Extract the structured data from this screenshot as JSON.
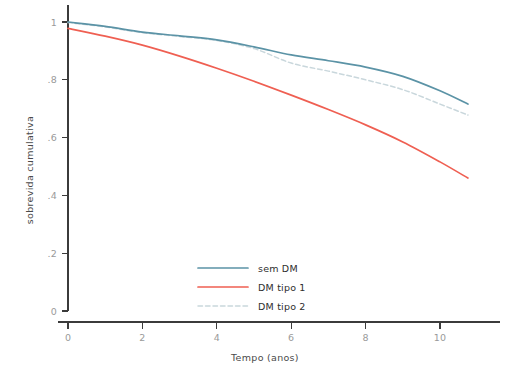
{
  "chart_data": {
    "type": "line",
    "title": "",
    "xlabel": "Tempo (anos)",
    "ylabel": "sobrevida cumulativa",
    "xlim": [
      0,
      11.6
    ],
    "ylim": [
      0,
      1.06
    ],
    "grid": false,
    "legend_position": "inside-bottom-center",
    "xticks": [
      "0",
      "2",
      "4",
      "6",
      "8",
      "10"
    ],
    "xtick_values": [
      0,
      2,
      4,
      6,
      8,
      10
    ],
    "yticks": [
      "0",
      ".2",
      ".4",
      ".6",
      ".8",
      "1"
    ],
    "ytick_values": [
      0,
      0.2,
      0.4,
      0.6,
      0.8,
      1.0
    ],
    "x": [
      0,
      1,
      2,
      3,
      4,
      5,
      6,
      7,
      8,
      9,
      10,
      10.75
    ],
    "series": [
      {
        "name": "sem DM",
        "color": "#5b93a6",
        "style": "solid",
        "values": [
          1.0,
          0.985,
          0.965,
          0.952,
          0.938,
          0.914,
          0.886,
          0.866,
          0.844,
          0.812,
          0.762,
          0.716
        ]
      },
      {
        "name": "DM tipo 1",
        "color": "#ef5f52",
        "style": "solid",
        "values": [
          0.978,
          0.951,
          0.92,
          0.882,
          0.84,
          0.795,
          0.747,
          0.697,
          0.644,
          0.585,
          0.516,
          0.46
        ]
      },
      {
        "name": "DM tipo 2",
        "color": "#c9d7dc",
        "style": "dashed",
        "values": [
          0.998,
          0.983,
          0.963,
          0.95,
          0.936,
          0.908,
          0.858,
          0.83,
          0.8,
          0.766,
          0.716,
          0.678
        ]
      }
    ]
  },
  "legend": {
    "items": [
      {
        "label": "sem DM"
      },
      {
        "label": "DM tipo 1"
      },
      {
        "label": "DM tipo 2"
      }
    ]
  },
  "axes": {
    "x_title": "Tempo (anos)",
    "y_title": "sobrevida cumulativa"
  }
}
